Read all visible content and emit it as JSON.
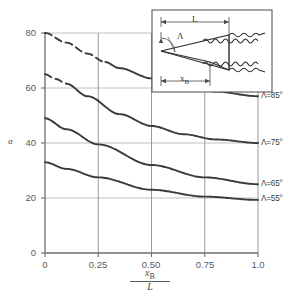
{
  "chart_data": {
    "type": "line",
    "title": "",
    "xlabel": "xB/L",
    "ylabel": "α",
    "xlim": [
      0,
      1.0
    ],
    "ylim": [
      0,
      80
    ],
    "grid": true,
    "legend_position": "right-inline",
    "x_ticks": [
      "0",
      "0.25",
      "0.50",
      "0.75",
      "1.0"
    ],
    "x_tick_values": [
      0,
      0.25,
      0.5,
      0.75,
      1.0
    ],
    "y_ticks": [
      "0",
      "20",
      "40",
      "60",
      "80"
    ],
    "y_tick_values": [
      0,
      20,
      40,
      60,
      80
    ],
    "series": [
      {
        "name": "Λ=85°",
        "label": "Λ=85°",
        "x": [
          0,
          0.1,
          0.2,
          0.28,
          0.35,
          0.5,
          0.65,
          0.8,
          1.0
        ],
        "values": [
          80,
          76.5,
          72.5,
          69.5,
          67.2,
          63.5,
          60.8,
          58.7,
          57.0
        ],
        "dashed_until_x": 0.28
      },
      {
        "name": "Λ=75°",
        "label": "Λ=75°",
        "x": [
          0,
          0.05,
          0.1,
          0.2,
          0.35,
          0.5,
          0.65,
          0.8,
          1.0
        ],
        "values": [
          65,
          63.3,
          61.6,
          57.0,
          50.5,
          46.2,
          43.2,
          41.3,
          40.0
        ],
        "dashed_until_x": 0.1
      },
      {
        "name": "Λ=65°",
        "label": "Λ=65°",
        "x": [
          0,
          0.1,
          0.25,
          0.5,
          0.75,
          1.0
        ],
        "values": [
          49,
          45.0,
          39.5,
          32.0,
          27.5,
          25.0
        ],
        "dashed_until_x": 0
      },
      {
        "name": "Λ=55°",
        "label": "Λ=55°",
        "x": [
          0,
          0.1,
          0.25,
          0.5,
          0.75,
          1.0
        ],
        "values": [
          33,
          30.6,
          27.5,
          23.0,
          20.5,
          19.3
        ],
        "dashed_until_x": 0
      }
    ]
  },
  "axis": {
    "y_label": "α",
    "x_label_numerator": "x",
    "x_label_numerator_sub": "B",
    "x_label_denominator": "L"
  },
  "inset": {
    "length_label": "L",
    "sweep_label": "Λ",
    "station_label": "x",
    "station_label_sub": "B"
  },
  "colors": {
    "curve": "#3b3b3b",
    "grid": "#b8b8b8",
    "axis": "#6e6e6e",
    "text": "#4a4a4a",
    "background": "#ffffff",
    "inset_border": "#5a5a5a"
  }
}
